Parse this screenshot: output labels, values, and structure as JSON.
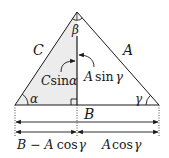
{
  "diagram": {
    "colors": {
      "stroke": "#1a1a1a",
      "shade": "#ececec",
      "background": "#ffffff"
    },
    "vertices": {
      "apex": {
        "x": 77,
        "y": 12
      },
      "left": {
        "x": 15,
        "y": 105
      },
      "right": {
        "x": 159,
        "y": 105
      },
      "altitude_foot": {
        "x": 77,
        "y": 105
      }
    },
    "sides": {
      "left": "C",
      "right": "A",
      "base": "B"
    },
    "angles": {
      "left": "α",
      "apex": "β",
      "right": "γ"
    },
    "altitude_labels": {
      "left": {
        "coef": "C",
        "fn": "sin",
        "arg": "α"
      },
      "right": {
        "coef": "A",
        "fn": "sin",
        "arg": "γ"
      }
    },
    "dimensions": {
      "full": "B",
      "left_segment": {
        "prefix": "B − A",
        "fn": "cos",
        "arg": "γ"
      },
      "right_segment": {
        "coef": "A",
        "fn": "cos",
        "arg": "γ"
      }
    }
  }
}
